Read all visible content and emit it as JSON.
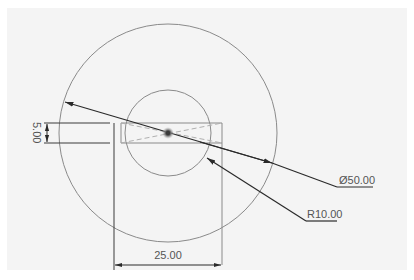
{
  "drawing": {
    "view": "sketch",
    "colors": {
      "background": "#f4f4f4",
      "geometry": "#8a8a8a",
      "dimension": "#3a3a3a",
      "construction": "#b0b0b0",
      "center_point": "#555555",
      "text": "#555555"
    },
    "center": {
      "x": 168,
      "y": 133
    },
    "outer_circle": {
      "radius_px": 109
    },
    "inner_circle": {
      "radius_px": 43
    },
    "rectangle": {
      "left": 114,
      "right": 222,
      "top": 123,
      "band_bottom": 143,
      "bottom": 265
    }
  },
  "dimensions": {
    "diameter": {
      "label": "Ø50.00"
    },
    "radius": {
      "label": "R10.00"
    },
    "width": {
      "label": "25.00"
    },
    "height": {
      "label": "5.00"
    }
  },
  "footer": {
    "cut_text": ""
  }
}
